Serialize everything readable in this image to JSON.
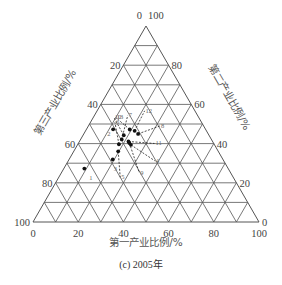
{
  "caption": "(c) 2005年",
  "axes": {
    "bottom": {
      "title": "第一产业比例/%",
      "ticks": [
        "0",
        "20",
        "40",
        "60",
        "80",
        "100"
      ]
    },
    "right": {
      "title": "第二产业比例/%",
      "ticks": [
        "0",
        "20",
        "40",
        "60",
        "80",
        "100"
      ]
    },
    "left": {
      "title": "第三产业比例/%",
      "ticks": [
        "0",
        "20",
        "40",
        "60",
        "80",
        "100"
      ]
    }
  },
  "colors": {
    "grid": "#555555",
    "point": "#111111",
    "leader": "#222222",
    "text": "#444444"
  },
  "chart_data": {
    "type": "ternary-scatter",
    "title": "(c) 2005年",
    "axes": {
      "a": {
        "label": "第一产业比例/%",
        "range": [
          0,
          100
        ],
        "position": "bottom"
      },
      "b": {
        "label": "第二产业比例/%",
        "range": [
          0,
          100
        ],
        "position": "right"
      },
      "c": {
        "label": "第三产业比例/%",
        "range": [
          0,
          100
        ],
        "position": "left"
      }
    },
    "grid": true,
    "grid_step": 10,
    "tick_labels": [
      0,
      20,
      40,
      60,
      80,
      100
    ],
    "points": [
      {
        "label": "1",
        "primary": 10,
        "secondary": 30,
        "tertiary": 70
      },
      {
        "label": "2",
        "primary": 13,
        "secondary": 52,
        "tertiary": 45
      },
      {
        "label": "3",
        "primary": 23,
        "secondary": 38,
        "tertiary": 58
      },
      {
        "label": "4",
        "primary": 30,
        "secondary": 50,
        "tertiary": 47
      },
      {
        "label": "5",
        "primary": 24,
        "secondary": 44,
        "tertiary": 54
      },
      {
        "label": "6",
        "primary": 22,
        "secondary": 48,
        "tertiary": 51
      },
      {
        "label": "7",
        "primary": 22,
        "secondary": 51,
        "tertiary": 48
      },
      {
        "label": "8",
        "primary": 31,
        "secondary": 58,
        "tertiary": 40
      },
      {
        "label": "9",
        "primary": 29,
        "secondary": 52,
        "tertiary": 48
      },
      {
        "label": "10",
        "primary": 22,
        "secondary": 54,
        "tertiary": 46
      },
      {
        "label": "11",
        "primary": 28,
        "secondary": 53,
        "tertiary": 48
      },
      {
        "label": "12",
        "primary": 28,
        "secondary": 60,
        "tertiary": 41
      },
      {
        "label": "13",
        "primary": 24,
        "secondary": 59,
        "tertiary": 42
      }
    ]
  }
}
